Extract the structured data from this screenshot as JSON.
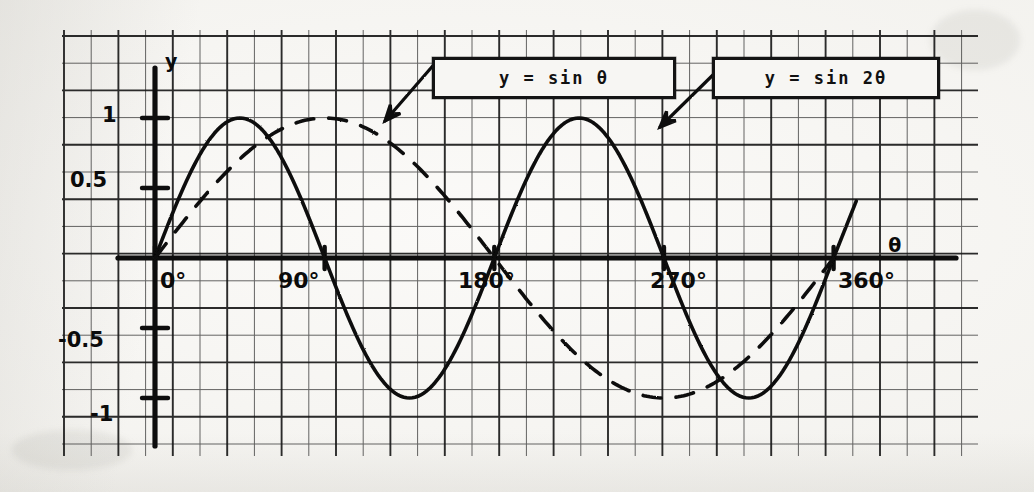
{
  "figure": {
    "kind": "hand-drawn graph on graph paper (scanned)",
    "background_color": "#f2f1ed",
    "ink_color": "#111111"
  },
  "axes": {
    "x_axis_name": "θ",
    "y_axis_name": "y",
    "x_ticks": [
      "0°",
      "90°",
      "180°",
      "270°",
      "360°"
    ],
    "x_tick_values": [
      0,
      90,
      180,
      270,
      360
    ],
    "y_ticks": [
      "1",
      "0.5",
      "-0.5",
      "-1"
    ],
    "y_tick_values": [
      1,
      0.5,
      -0.5,
      -1
    ],
    "xlim": [
      -25,
      400
    ],
    "ylim": [
      -1.32,
      1.35
    ]
  },
  "legend": [
    {
      "label": "y = sin θ",
      "style": "dashed",
      "points_to": "dashed-curve"
    },
    {
      "label": "y = sin 2θ",
      "style": "solid",
      "points_to": "solid-curve"
    }
  ],
  "chart_data": {
    "type": "line",
    "title": "",
    "xlabel": "θ",
    "ylabel": "y",
    "xlim": [
      0,
      360
    ],
    "ylim": [
      -1,
      1
    ],
    "grid": true,
    "legend_position": "top-center-right",
    "x_tick_labels": [
      "0°",
      "90°",
      "180°",
      "270°",
      "360°"
    ],
    "y_tick_labels": [
      "1",
      "0.5",
      "-0.5",
      "-1"
    ],
    "series": [
      {
        "name": "y = sin θ",
        "style": "dashed",
        "period_degrees": 360,
        "amplitude": 1,
        "x": [
          0,
          15,
          30,
          45,
          60,
          75,
          90,
          105,
          120,
          135,
          150,
          165,
          180,
          195,
          210,
          225,
          240,
          255,
          270,
          285,
          300,
          315,
          330,
          345,
          360
        ],
        "values": [
          0,
          0.259,
          0.5,
          0.707,
          0.866,
          0.966,
          1,
          0.966,
          0.866,
          0.707,
          0.5,
          0.259,
          0,
          -0.259,
          -0.5,
          -0.707,
          -0.866,
          -0.966,
          -1,
          -0.966,
          -0.866,
          -0.707,
          -0.5,
          -0.259,
          0
        ]
      },
      {
        "name": "y = sin 2θ",
        "style": "solid",
        "period_degrees": 180,
        "amplitude": 1,
        "x": [
          0,
          15,
          30,
          45,
          60,
          75,
          90,
          105,
          120,
          135,
          150,
          165,
          180,
          195,
          210,
          225,
          240,
          255,
          270,
          285,
          300,
          315,
          330,
          345,
          360
        ],
        "values": [
          0,
          0.5,
          0.866,
          1,
          0.866,
          0.5,
          0,
          -0.5,
          -0.866,
          -1,
          -0.866,
          -0.5,
          0,
          0.5,
          0.866,
          1,
          0.866,
          0.5,
          0,
          -0.5,
          -0.866,
          -1,
          -0.866,
          -0.5,
          0
        ]
      }
    ]
  }
}
